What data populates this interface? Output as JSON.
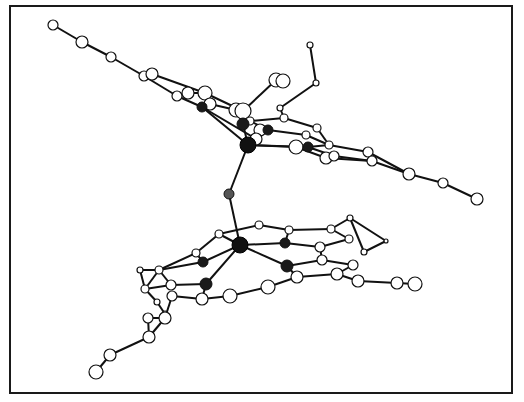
{
  "diagram": {
    "type": "ball-and-stick molecular structure",
    "colors": {
      "frame": "#1a1a1a",
      "bond": "#111111",
      "open_atom_fill": "#ffffff",
      "donor_atom_fill": "#1a1a1a",
      "metal_atom_fill": "#111111",
      "bridge_atom_fill": "#555555"
    },
    "atoms": [
      {
        "id": "M1",
        "kind": "metal",
        "x": 248,
        "y": 145,
        "r": 8
      },
      {
        "id": "M2",
        "kind": "metal",
        "x": 240,
        "y": 245,
        "r": 8
      },
      {
        "id": "O",
        "kind": "bridge",
        "x": 229,
        "y": 194,
        "r": 5
      },
      {
        "id": "N1a",
        "kind": "donor",
        "x": 243,
        "y": 124,
        "r": 6
      },
      {
        "id": "N1b",
        "kind": "donor",
        "x": 268,
        "y": 130,
        "r": 5
      },
      {
        "id": "N1c",
        "kind": "donor",
        "x": 308,
        "y": 147,
        "r": 5
      },
      {
        "id": "N1d",
        "kind": "donor",
        "x": 202,
        "y": 107,
        "r": 5
      },
      {
        "id": "N2a",
        "kind": "donor",
        "x": 203,
        "y": 262,
        "r": 5
      },
      {
        "id": "N2b",
        "kind": "donor",
        "x": 285,
        "y": 243,
        "r": 5
      },
      {
        "id": "N2c",
        "kind": "donor",
        "x": 287,
        "y": 266,
        "r": 6
      },
      {
        "id": "N2d",
        "kind": "donor",
        "x": 206,
        "y": 284,
        "r": 6
      },
      {
        "id": "a1",
        "kind": "open",
        "x": 53,
        "y": 25,
        "r": 5
      },
      {
        "id": "a2",
        "kind": "open",
        "x": 82,
        "y": 42,
        "r": 6
      },
      {
        "id": "a3",
        "kind": "open",
        "x": 111,
        "y": 57,
        "r": 5
      },
      {
        "id": "a4",
        "kind": "open",
        "x": 144,
        "y": 76,
        "r": 5
      },
      {
        "id": "a5",
        "kind": "open",
        "x": 152,
        "y": 74,
        "r": 6
      },
      {
        "id": "a6",
        "kind": "open",
        "x": 177,
        "y": 96,
        "r": 5
      },
      {
        "id": "a7",
        "kind": "open",
        "x": 188,
        "y": 93,
        "r": 6
      },
      {
        "id": "a8",
        "kind": "open",
        "x": 205,
        "y": 93,
        "r": 7
      },
      {
        "id": "a9",
        "kind": "open",
        "x": 210,
        "y": 104,
        "r": 6
      },
      {
        "id": "a10",
        "kind": "open",
        "x": 236,
        "y": 110,
        "r": 7
      },
      {
        "id": "a11",
        "kind": "open",
        "x": 243,
        "y": 111,
        "r": 8
      },
      {
        "id": "a12",
        "kind": "open",
        "x": 250,
        "y": 121,
        "r": 4
      },
      {
        "id": "a13",
        "kind": "open",
        "x": 260,
        "y": 130,
        "r": 6
      },
      {
        "id": "a14",
        "kind": "open",
        "x": 256,
        "y": 139,
        "r": 6
      },
      {
        "id": "a15",
        "kind": "open",
        "x": 276,
        "y": 80,
        "r": 7
      },
      {
        "id": "a16",
        "kind": "open",
        "x": 283,
        "y": 81,
        "r": 7
      },
      {
        "id": "a17",
        "kind": "open",
        "x": 310,
        "y": 45,
        "r": 3
      },
      {
        "id": "a18",
        "kind": "open",
        "x": 316,
        "y": 83,
        "r": 3
      },
      {
        "id": "a19",
        "kind": "open",
        "x": 280,
        "y": 108,
        "r": 3
      },
      {
        "id": "a20",
        "kind": "open",
        "x": 284,
        "y": 118,
        "r": 4
      },
      {
        "id": "a21",
        "kind": "open",
        "x": 317,
        "y": 128,
        "r": 4
      },
      {
        "id": "a22",
        "kind": "open",
        "x": 306,
        "y": 135,
        "r": 4
      },
      {
        "id": "a23",
        "kind": "open",
        "x": 296,
        "y": 147,
        "r": 7
      },
      {
        "id": "a24",
        "kind": "open",
        "x": 329,
        "y": 145,
        "r": 4
      },
      {
        "id": "a25",
        "kind": "open",
        "x": 326,
        "y": 158,
        "r": 6
      },
      {
        "id": "a26",
        "kind": "open",
        "x": 334,
        "y": 156,
        "r": 5
      },
      {
        "id": "a27",
        "kind": "open",
        "x": 368,
        "y": 152,
        "r": 5
      },
      {
        "id": "a28",
        "kind": "open",
        "x": 372,
        "y": 161,
        "r": 5
      },
      {
        "id": "a29",
        "kind": "open",
        "x": 409,
        "y": 174,
        "r": 6
      },
      {
        "id": "a30",
        "kind": "open",
        "x": 443,
        "y": 183,
        "r": 5
      },
      {
        "id": "a31",
        "kind": "open",
        "x": 477,
        "y": 199,
        "r": 6
      },
      {
        "id": "b1",
        "kind": "open",
        "x": 219,
        "y": 234,
        "r": 4
      },
      {
        "id": "b2",
        "kind": "open",
        "x": 259,
        "y": 225,
        "r": 4
      },
      {
        "id": "b3",
        "kind": "open",
        "x": 289,
        "y": 230,
        "r": 4
      },
      {
        "id": "b4",
        "kind": "open",
        "x": 331,
        "y": 229,
        "r": 4
      },
      {
        "id": "b5",
        "kind": "open",
        "x": 350,
        "y": 218,
        "r": 3
      },
      {
        "id": "b6",
        "kind": "open",
        "x": 349,
        "y": 239,
        "r": 4
      },
      {
        "id": "b7",
        "kind": "open",
        "x": 320,
        "y": 247,
        "r": 5
      },
      {
        "id": "b8",
        "kind": "open",
        "x": 322,
        "y": 260,
        "r": 5
      },
      {
        "id": "b9",
        "kind": "open",
        "x": 353,
        "y": 265,
        "r": 5
      },
      {
        "id": "b10",
        "kind": "open",
        "x": 337,
        "y": 274,
        "r": 6
      },
      {
        "id": "b11",
        "kind": "open",
        "x": 358,
        "y": 281,
        "r": 6
      },
      {
        "id": "b12",
        "kind": "open",
        "x": 397,
        "y": 283,
        "r": 6
      },
      {
        "id": "b13",
        "kind": "open",
        "x": 415,
        "y": 284,
        "r": 7
      },
      {
        "id": "b14",
        "kind": "open",
        "x": 364,
        "y": 252,
        "r": 3
      },
      {
        "id": "b15",
        "kind": "open",
        "x": 386,
        "y": 241,
        "r": 2
      },
      {
        "id": "b16",
        "kind": "open",
        "x": 297,
        "y": 277,
        "r": 6
      },
      {
        "id": "b17",
        "kind": "open",
        "x": 268,
        "y": 287,
        "r": 7
      },
      {
        "id": "b18",
        "kind": "open",
        "x": 230,
        "y": 296,
        "r": 7
      },
      {
        "id": "b19",
        "kind": "open",
        "x": 202,
        "y": 299,
        "r": 6
      },
      {
        "id": "b20",
        "kind": "open",
        "x": 172,
        "y": 296,
        "r": 5
      },
      {
        "id": "b21",
        "kind": "open",
        "x": 171,
        "y": 285,
        "r": 5
      },
      {
        "id": "b22",
        "kind": "open",
        "x": 159,
        "y": 270,
        "r": 4
      },
      {
        "id": "b23",
        "kind": "open",
        "x": 140,
        "y": 270,
        "r": 3
      },
      {
        "id": "b24",
        "kind": "open",
        "x": 145,
        "y": 289,
        "r": 4
      },
      {
        "id": "b25",
        "kind": "open",
        "x": 157,
        "y": 302,
        "r": 3
      },
      {
        "id": "b26",
        "kind": "open",
        "x": 165,
        "y": 314,
        "r": 3
      },
      {
        "id": "b27",
        "kind": "open",
        "x": 148,
        "y": 318,
        "r": 5
      },
      {
        "id": "b28",
        "kind": "open",
        "x": 165,
        "y": 318,
        "r": 6
      },
      {
        "id": "b29",
        "kind": "open",
        "x": 149,
        "y": 337,
        "r": 6
      },
      {
        "id": "b30",
        "kind": "open",
        "x": 110,
        "y": 355,
        "r": 6
      },
      {
        "id": "b31",
        "kind": "open",
        "x": 96,
        "y": 372,
        "r": 7
      },
      {
        "id": "b32",
        "kind": "open",
        "x": 196,
        "y": 253,
        "r": 4
      }
    ],
    "bonds": [
      [
        "M1",
        "O"
      ],
      [
        "O",
        "M2"
      ],
      [
        "M1",
        "N1a"
      ],
      [
        "M1",
        "N1b"
      ],
      [
        "M1",
        "N1c"
      ],
      [
        "M1",
        "N1d"
      ],
      [
        "a1",
        "a2"
      ],
      [
        "a2",
        "a3"
      ],
      [
        "a3",
        "a4"
      ],
      [
        "a4",
        "a5"
      ],
      [
        "a5",
        "a8"
      ],
      [
        "a4",
        "a6"
      ],
      [
        "a6",
        "N1d"
      ],
      [
        "N1d",
        "a9"
      ],
      [
        "a9",
        "a10"
      ],
      [
        "a7",
        "a8"
      ],
      [
        "a8",
        "a11"
      ],
      [
        "a10",
        "N1a"
      ],
      [
        "a11",
        "N1a"
      ],
      [
        "N1a",
        "a12"
      ],
      [
        "a12",
        "N1b"
      ],
      [
        "N1b",
        "a13"
      ],
      [
        "a13",
        "a14"
      ],
      [
        "a11",
        "a15"
      ],
      [
        "a15",
        "a16"
      ],
      [
        "a17",
        "a18"
      ],
      [
        "a18",
        "a19"
      ],
      [
        "a19",
        "a20"
      ],
      [
        "a12",
        "a20"
      ],
      [
        "a20",
        "a21"
      ],
      [
        "N1b",
        "a22"
      ],
      [
        "a22",
        "a24"
      ],
      [
        "a21",
        "a24"
      ],
      [
        "N1c",
        "a23"
      ],
      [
        "N1c",
        "a24"
      ],
      [
        "N1c",
        "a26"
      ],
      [
        "a23",
        "a25"
      ],
      [
        "a24",
        "a27"
      ],
      [
        "a26",
        "a28"
      ],
      [
        "a25",
        "a28"
      ],
      [
        "a27",
        "a29"
      ],
      [
        "a28",
        "a29"
      ],
      [
        "a29",
        "a30"
      ],
      [
        "a30",
        "a31"
      ],
      [
        "M1",
        "a23"
      ],
      [
        "N1d",
        "a14"
      ],
      [
        "M2",
        "N2a"
      ],
      [
        "M2",
        "N2b"
      ],
      [
        "M2",
        "N2c"
      ],
      [
        "M2",
        "N2d"
      ],
      [
        "b1",
        "b2"
      ],
      [
        "b2",
        "b3"
      ],
      [
        "b3",
        "b4"
      ],
      [
        "b4",
        "b5"
      ],
      [
        "b5",
        "b15"
      ],
      [
        "b15",
        "b14"
      ],
      [
        "b14",
        "b5"
      ],
      [
        "b4",
        "b6"
      ],
      [
        "N2b",
        "b3"
      ],
      [
        "N2b",
        "b7"
      ],
      [
        "b7",
        "b6"
      ],
      [
        "b7",
        "b8"
      ],
      [
        "N2c",
        "b8"
      ],
      [
        "b8",
        "b9"
      ],
      [
        "b9",
        "b10"
      ],
      [
        "b10",
        "b16"
      ],
      [
        "b10",
        "b11"
      ],
      [
        "b11",
        "b12"
      ],
      [
        "b12",
        "b13"
      ],
      [
        "N2c",
        "b16"
      ],
      [
        "b16",
        "b17"
      ],
      [
        "b17",
        "b18"
      ],
      [
        "b18",
        "b19"
      ],
      [
        "b19",
        "b20"
      ],
      [
        "N2d",
        "b19"
      ],
      [
        "N2d",
        "b21"
      ],
      [
        "b21",
        "b22"
      ],
      [
        "b22",
        "N2a"
      ],
      [
        "N2a",
        "b32"
      ],
      [
        "b32",
        "b1"
      ],
      [
        "b32",
        "b22"
      ],
      [
        "b22",
        "b23"
      ],
      [
        "b23",
        "b24"
      ],
      [
        "b24",
        "b22"
      ],
      [
        "b24",
        "b25"
      ],
      [
        "b25",
        "b26"
      ],
      [
        "b21",
        "b24"
      ],
      [
        "b20",
        "b28"
      ],
      [
        "b28",
        "b27"
      ],
      [
        "b27",
        "b29"
      ],
      [
        "b28",
        "b29"
      ],
      [
        "b29",
        "b30"
      ],
      [
        "b30",
        "b31"
      ],
      [
        "b1",
        "M2"
      ]
    ]
  }
}
